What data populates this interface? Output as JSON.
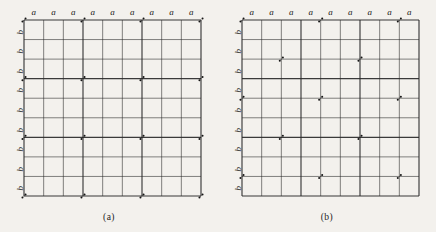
{
  "figure": {
    "background_color": "#f3f1ed",
    "line_color": "#2a2a2a",
    "marker_color": "#151515",
    "panels": [
      {
        "id": "a",
        "caption": "(a)",
        "grid": {
          "columns": 9,
          "rows": 9,
          "x0": 24,
          "y0": 20,
          "x1": 201,
          "y1": 196
        },
        "top_labels": [
          "a",
          "a",
          "a",
          "a",
          "a",
          "a",
          "a",
          "a",
          "a"
        ],
        "left_labels": [
          "b",
          "b",
          "b",
          "b",
          "b",
          "b",
          "b",
          "b",
          "b"
        ],
        "markers": [
          {
            "col": 0,
            "row": 0
          },
          {
            "col": 3,
            "row": 0
          },
          {
            "col": 6,
            "row": 0
          },
          {
            "col": 9,
            "row": 0
          },
          {
            "col": 0,
            "row": 3
          },
          {
            "col": 3,
            "row": 3
          },
          {
            "col": 6,
            "row": 3
          },
          {
            "col": 9,
            "row": 3
          },
          {
            "col": 0,
            "row": 6
          },
          {
            "col": 3,
            "row": 6
          },
          {
            "col": 6,
            "row": 6
          },
          {
            "col": 9,
            "row": 6
          },
          {
            "col": 0,
            "row": 9
          },
          {
            "col": 3,
            "row": 9
          },
          {
            "col": 6,
            "row": 9
          },
          {
            "col": 9,
            "row": 9
          }
        ]
      },
      {
        "id": "b",
        "caption": "(b)",
        "grid": {
          "columns": 9,
          "rows": 9,
          "x0": 24,
          "y0": 20,
          "x1": 201,
          "y1": 196
        },
        "top_labels": [
          "a",
          "a",
          "a",
          "a",
          "a",
          "a",
          "a",
          "a",
          "a"
        ],
        "left_labels": [
          "b",
          "b",
          "b",
          "b",
          "b",
          "b",
          "b",
          "b",
          "b"
        ],
        "markers": [
          {
            "col": 0,
            "row": 0
          },
          {
            "col": 4,
            "row": 0
          },
          {
            "col": 8,
            "row": 0
          },
          {
            "col": 2,
            "row": 2
          },
          {
            "col": 6,
            "row": 2
          },
          {
            "col": 0,
            "row": 4
          },
          {
            "col": 4,
            "row": 4
          },
          {
            "col": 8,
            "row": 4
          },
          {
            "col": 2,
            "row": 6
          },
          {
            "col": 6,
            "row": 6
          },
          {
            "col": 0,
            "row": 8
          },
          {
            "col": 4,
            "row": 8
          },
          {
            "col": 8,
            "row": 8
          }
        ]
      }
    ]
  }
}
